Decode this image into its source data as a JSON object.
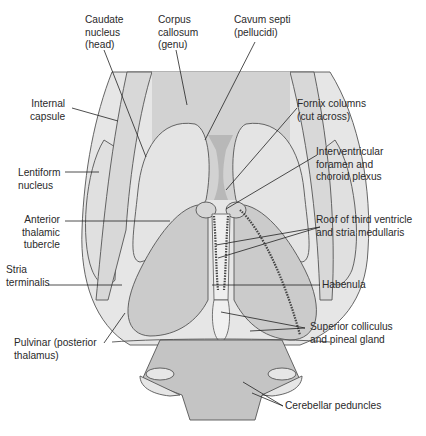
{
  "diagram": {
    "colors": {
      "background": "#ffffff",
      "outer_mass": "#e2e2e2",
      "cortex_band": "#d6d6d6",
      "nucleus": "#dcdcdc",
      "thalamus": "#c9c9c9",
      "dark_septum": "#b3b3b3",
      "brainstem": "#c2c2c2",
      "pineal": "#efefef",
      "outline": "#555555",
      "leader": "#222222",
      "text": "#2a2a2a"
    },
    "labels": [
      {
        "id": "caudate-nucleus",
        "text": "Caudate\nnucleus\n(head)"
      },
      {
        "id": "corpus-callosum",
        "text": "Corpus\ncallosum\n(genu)"
      },
      {
        "id": "cavum-septi",
        "text": "Cavum septi\n(pellucidi)"
      },
      {
        "id": "internal-capsule",
        "text": "Internal\ncapsule"
      },
      {
        "id": "fornix-columns",
        "text": "Fornix columns\n(cut across)"
      },
      {
        "id": "interventricular-foramen",
        "text": "Interventricular\nforamen and\nchoroid plexus"
      },
      {
        "id": "lentiform-nucleus",
        "text": "Lentiform\nnucleus"
      },
      {
        "id": "anterior-thalamic-tubercle",
        "text": "Anterior\nthalamic\ntubercle"
      },
      {
        "id": "roof-third-ventricle",
        "text": "Roof of third ventricle\nand stria medullaris"
      },
      {
        "id": "stria-terminalis",
        "text": "Stria\nterminalis"
      },
      {
        "id": "habenula",
        "text": "Habenula"
      },
      {
        "id": "pulvinar",
        "text": "Pulvinar (posterior\nthalamus)"
      },
      {
        "id": "superior-colliculus",
        "text": "Superior colliculus\nand pineal gland"
      },
      {
        "id": "cerebellar-peduncles",
        "text": "Cerebellar peduncles"
      }
    ]
  }
}
